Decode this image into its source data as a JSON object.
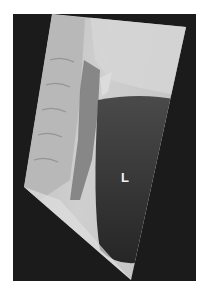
{
  "figure": {
    "type": "lateral neck radiograph",
    "annotation_label": "L",
    "colors": {
      "background": "#ffffff",
      "frame": "#1b1b1b",
      "soft_tissue_light": "#c9c9c9",
      "airway_dark": "#2e2e2e",
      "label": "#f2f2f2"
    }
  }
}
